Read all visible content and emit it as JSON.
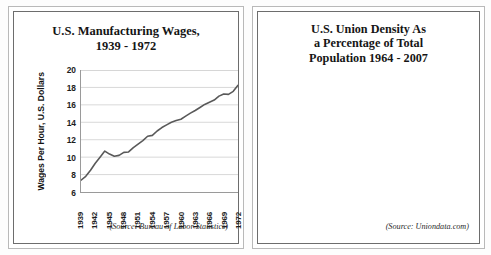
{
  "figure": {
    "background": "#ffffff",
    "panel_border": "#6d6d6d"
  },
  "left_panel": {
    "title_line1": "U.S. Manufacturing Wages,",
    "title_line2": "1939 - 1972",
    "source": "(Source: Bureau of Labor Statistics)",
    "y_axis_title": "Wages Per Hour, U.S. Dollars"
  },
  "right_panel": {
    "title_line1": "U.S. Union Density As",
    "title_line2": "a Percentage of Total",
    "title_line3": "Population 1964 - 2007",
    "source": "(Source: Uniondata.com)"
  },
  "chart_data": [
    {
      "type": "line",
      "title": "U.S. Manufacturing Wages, 1939 - 1972",
      "xlabel": "",
      "ylabel": "Wages Per Hour, U.S. Dollars",
      "ylim": [
        6,
        20
      ],
      "yticks": [
        6,
        8,
        10,
        12,
        14,
        16,
        18,
        20
      ],
      "ytick_labels": [
        "6",
        "8",
        "10",
        "12",
        "14",
        "16",
        "18",
        "20"
      ],
      "xlim": [
        1939,
        1972
      ],
      "xticks": [
        1939,
        1942,
        1945,
        1948,
        1951,
        1954,
        1957,
        1960,
        1963,
        1966,
        1969,
        1972
      ],
      "xtick_labels": [
        "1939",
        "1942",
        "1945",
        "1948",
        "1951",
        "1954",
        "1957",
        "1960",
        "1963",
        "1966",
        "1969",
        "1972"
      ],
      "grid": "horizontal",
      "line_color": "#595959",
      "legend": "none",
      "source": "(Source: Bureau of Labor Statistics)",
      "x": [
        1939,
        1940,
        1941,
        1942,
        1943,
        1944,
        1945,
        1946,
        1947,
        1948,
        1949,
        1950,
        1951,
        1952,
        1953,
        1954,
        1955,
        1956,
        1957,
        1958,
        1959,
        1960,
        1961,
        1962,
        1963,
        1964,
        1965,
        1966,
        1967,
        1968,
        1969,
        1970,
        1971,
        1972
      ],
      "values": [
        7.35,
        7.8,
        8.5,
        9.3,
        10.0,
        10.7,
        10.35,
        10.1,
        10.2,
        10.55,
        10.6,
        11.1,
        11.5,
        11.9,
        12.4,
        12.5,
        13.0,
        13.4,
        13.7,
        14.0,
        14.2,
        14.35,
        14.7,
        15.05,
        15.35,
        15.7,
        16.05,
        16.3,
        16.55,
        17.0,
        17.25,
        17.2,
        17.55,
        18.25
      ]
    },
    {
      "type": "bar",
      "title": "U.S. Union Density As a Percentage of Total Population 1964 - 2007",
      "xlabel": "",
      "ylabel": "",
      "ylim": [
        0.0,
        35.0
      ],
      "yticks": [
        0.0,
        5.0,
        10.0,
        15.0,
        20.0,
        25.0,
        30.0,
        35.0
      ],
      "ytick_labels": [
        "0.0",
        "5.0",
        "10.0",
        "15.0",
        "20.0",
        "25.0",
        "30.0",
        "35.0"
      ],
      "xticks": [
        1964,
        1967,
        1970,
        1973,
        1976,
        1979,
        1982,
        1985,
        1988,
        1991,
        1994,
        1997,
        2000,
        2003,
        2006
      ],
      "xtick_labels": [
        "1964",
        "1967",
        "1970",
        "1973",
        "1976",
        "1979",
        "1982",
        "1985",
        "1988",
        "1991",
        "1994",
        "1997",
        "2000",
        "2003",
        "2006"
      ],
      "grid": "horizontal",
      "bar_color": "#3b3b3b",
      "legend": "none",
      "source": "(Source: Uniondata.com)",
      "categories": [
        1964,
        1965,
        1966,
        1967,
        1968,
        1969,
        1970,
        1971,
        1972,
        1973,
        1974,
        1975,
        1976,
        1977,
        1978,
        1979,
        1980,
        1981,
        1982,
        1983,
        1984,
        1985,
        1986,
        1987,
        1988,
        1989,
        1990,
        1991,
        1992,
        1993,
        1994,
        1995,
        1996,
        1997,
        1998,
        1999,
        2000,
        2001,
        2002,
        2003,
        2004,
        2005,
        2006,
        2007
      ],
      "values": [
        29.3,
        28.6,
        28.5,
        28.4,
        28.3,
        28.2,
        28.1,
        27.6,
        27.3,
        27.1,
        26.5,
        26.3,
        25.0,
        24.8,
        24.3,
        24.1,
        23.6,
        22.3,
        21.0,
        20.1,
        19.1,
        18.0,
        17.5,
        17.0,
        16.8,
        16.4,
        16.1,
        16.1,
        15.8,
        15.8,
        15.5,
        14.9,
        14.5,
        14.1,
        13.9,
        13.9,
        13.5,
        13.4,
        13.3,
        12.9,
        12.5,
        12.5,
        12.0,
        12.1
      ]
    }
  ]
}
